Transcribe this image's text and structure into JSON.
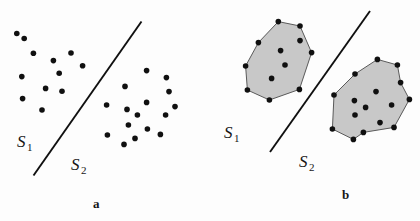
{
  "figure": {
    "background_color": "#fdfdfd",
    "dot_color": "#101010",
    "line_color": "#101010",
    "hull_fill_color": "#c8c8c8",
    "hull_stroke_color": "#5a5a5a",
    "dot_radius": 2.8,
    "line_width": 1.9,
    "hull_stroke_width": 1.0
  },
  "panels": [
    {
      "id": "a",
      "caption": "a",
      "labels": [
        {
          "name": "S1",
          "base": "S",
          "sub": "1",
          "x": 17,
          "y": 147
        },
        {
          "name": "S2",
          "base": "S",
          "sub": "2",
          "x": 71,
          "y": 170
        }
      ],
      "separating_line": {
        "x1": 141.5,
        "y1": 21.5,
        "x2": 33.5,
        "y2": 175.5
      },
      "clusters": [
        {
          "name": "S1-points",
          "points": [
            [
              16.8,
              33.5
            ],
            [
              24.2,
              38.5
            ],
            [
              33.4,
              53.2
            ],
            [
              53.4,
              60.6
            ],
            [
              71.0,
              53.0
            ],
            [
              82.6,
              65.8
            ],
            [
              21.8,
              76.6
            ],
            [
              59.2,
              73.2
            ],
            [
              45.6,
              88.4
            ],
            [
              62.0,
              91.2
            ],
            [
              22.6,
              98.6
            ],
            [
              42.0,
              110.0
            ]
          ]
        },
        {
          "name": "S2-points",
          "points": [
            [
              146.6,
              70.6
            ],
            [
              166.4,
              77.6
            ],
            [
              125.0,
              86.4
            ],
            [
              169.0,
              91.6
            ],
            [
              106.6,
              105.0
            ],
            [
              146.6,
              102.4
            ],
            [
              175.0,
              106.6
            ],
            [
              127.0,
              109.4
            ],
            [
              137.4,
              115.0
            ],
            [
              165.6,
              115.0
            ],
            [
              128.4,
              125.0
            ],
            [
              147.4,
              129.0
            ],
            [
              107.4,
              135.0
            ],
            [
              160.4,
              134.4
            ],
            [
              135.0,
              138.4
            ],
            [
              124.0,
              144.4
            ]
          ]
        }
      ]
    },
    {
      "id": "b",
      "caption": "b",
      "labels": [
        {
          "name": "S1",
          "base": "S",
          "sub": "1",
          "x": 224,
          "y": 138
        },
        {
          "name": "S2",
          "base": "S",
          "sub": "2",
          "x": 299,
          "y": 167
        }
      ],
      "separating_line": {
        "x1": 370.0,
        "y1": 11.0,
        "x2": 270.0,
        "y2": 152.0
      },
      "hulls": [
        {
          "name": "S1-convex-hull",
          "vertices": [
            [
              278.3,
              21.6
            ],
            [
              300.0,
              26.0
            ],
            [
              311.6,
              52.6
            ],
            [
              299.4,
              89.4
            ],
            [
              269.4,
              100.0
            ],
            [
              247.4,
              90.0
            ],
            [
              245.6,
              66.0
            ],
            [
              258.4,
              42.6
            ]
          ],
          "interior_points": [
            [
              300.0,
              40.6
            ],
            [
              280.6,
              50.6
            ],
            [
              285.0,
              65.0
            ],
            [
              271.6,
              78.4
            ]
          ]
        },
        {
          "name": "S2-convex-hull",
          "vertices": [
            [
              377.4,
              59.4
            ],
            [
              397.4,
              65.0
            ],
            [
              400.6,
              82.6
            ],
            [
              409.4,
              99.4
            ],
            [
              394.0,
              127.4
            ],
            [
              363.4,
              132.4
            ],
            [
              353.4,
              139.4
            ],
            [
              332.4,
              129.0
            ],
            [
              334.0,
              95.0
            ],
            [
              355.0,
              74.0
            ]
          ],
          "interior_points": [
            [
              376.0,
              91.6
            ],
            [
              354.4,
              100.6
            ],
            [
              365.6,
              107.4
            ],
            [
              391.6,
              105.0
            ],
            [
              355.0,
              115.0
            ],
            [
              380.0,
              122.6
            ]
          ]
        }
      ]
    }
  ],
  "chart_data": {
    "type": "scatter",
    "title": "",
    "subtitle": "",
    "xlabel": "",
    "ylabel": "",
    "grid": false,
    "legend_position": "none",
    "series": [
      {
        "name": "S1",
        "panel": "a",
        "marker": "filled-circle",
        "color": "#101010",
        "count": 12,
        "x": [
          16.8,
          24.2,
          33.4,
          53.4,
          71.0,
          82.6,
          21.8,
          59.2,
          45.6,
          62.0,
          22.6,
          42.0
        ],
        "y": [
          33.5,
          38.5,
          53.2,
          60.6,
          53.0,
          65.8,
          76.6,
          73.2,
          88.4,
          91.2,
          98.6,
          110.0
        ]
      },
      {
        "name": "S2",
        "panel": "a",
        "marker": "filled-circle",
        "color": "#101010",
        "count": 16,
        "x": [
          146.6,
          166.4,
          125.0,
          169.0,
          106.6,
          146.6,
          175.0,
          127.0,
          137.4,
          165.6,
          128.4,
          147.4,
          107.4,
          160.4,
          135.0,
          124.0
        ],
        "y": [
          70.6,
          77.6,
          86.4,
          91.6,
          105.0,
          102.4,
          106.6,
          109.4,
          115.0,
          115.0,
          125.0,
          129.0,
          135.0,
          134.4,
          138.4,
          144.4
        ]
      },
      {
        "name": "S1-hull",
        "panel": "b",
        "marker": "filled-circle",
        "color": "#101010",
        "hull_vertices": 8,
        "interior_points": 4
      },
      {
        "name": "S2-hull",
        "panel": "b",
        "marker": "filled-circle",
        "color": "#101010",
        "hull_vertices": 10,
        "interior_points": 6
      }
    ],
    "annotations": [
      {
        "text": "S1",
        "panel": "a"
      },
      {
        "text": "S2",
        "panel": "a"
      },
      {
        "text": "a",
        "panel": "a"
      },
      {
        "text": "S1",
        "panel": "b"
      },
      {
        "text": "S2",
        "panel": "b"
      },
      {
        "text": "b",
        "panel": "b"
      }
    ]
  }
}
